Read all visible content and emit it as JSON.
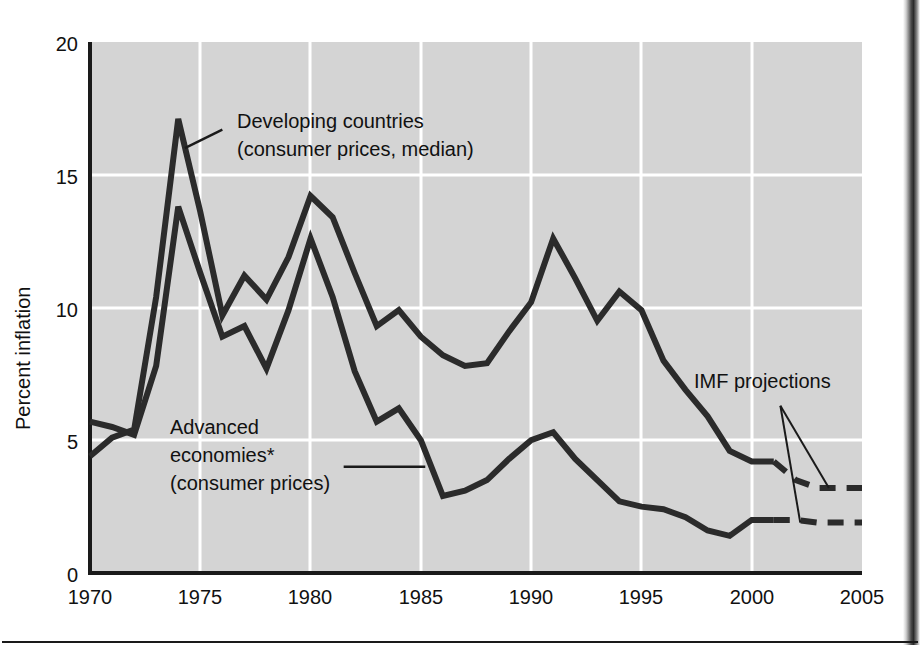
{
  "chart_data": {
    "type": "line",
    "title": "",
    "xlabel": "",
    "ylabel": "Percent inflation",
    "xlim": [
      1970,
      2005
    ],
    "ylim": [
      0,
      20
    ],
    "xticks": [
      "1970",
      "1975",
      "1980",
      "1985",
      "1990",
      "1995",
      "2000",
      "2005"
    ],
    "yticks": [
      "0",
      "5",
      "10",
      "15",
      "20"
    ],
    "grid": true,
    "legend_position": "inline-annotations",
    "plot_bg_color": "#d4d4d4",
    "gridline_color": "#ffffff",
    "line_color": "#2b2b2b",
    "x": [
      1970,
      1971,
      1972,
      1973,
      1974,
      1975,
      1976,
      1977,
      1978,
      1979,
      1980,
      1981,
      1982,
      1983,
      1984,
      1985,
      1986,
      1987,
      1988,
      1989,
      1990,
      1991,
      1992,
      1993,
      1994,
      1995,
      1996,
      1997,
      1998,
      1999,
      2000,
      2001,
      2002,
      2003,
      2004,
      2005
    ],
    "series": [
      {
        "name": "Developing countries (consumer prices, median)",
        "solid_through": 2001,
        "dashed_from": 2001,
        "values": [
          4.4,
          5.1,
          5.4,
          10.4,
          17.1,
          13.6,
          9.7,
          11.2,
          10.3,
          11.9,
          14.2,
          13.4,
          11.3,
          9.3,
          9.9,
          8.9,
          8.2,
          7.8,
          7.9,
          9.1,
          10.2,
          12.6,
          11.1,
          9.5,
          10.6,
          9.9,
          8.0,
          6.9,
          5.9,
          4.6,
          4.2,
          4.2,
          3.5,
          3.2,
          3.2,
          3.2
        ]
      },
      {
        "name": "Advanced economies* (consumer prices)",
        "solid_through": 2001,
        "dashed_from": 2001,
        "values": [
          5.7,
          5.5,
          5.2,
          7.8,
          13.8,
          11.3,
          8.9,
          9.3,
          7.7,
          9.9,
          12.6,
          10.4,
          7.6,
          5.7,
          6.2,
          5.0,
          2.9,
          3.1,
          3.5,
          4.3,
          5.0,
          5.3,
          4.3,
          3.5,
          2.7,
          2.5,
          2.4,
          2.1,
          1.6,
          1.4,
          2.0,
          2.0,
          2.0,
          1.9,
          1.9,
          1.9
        ]
      }
    ],
    "annotations": [
      {
        "id": "developing-annotation",
        "line1": "Developing countries",
        "line2": "(consumer prices, median)",
        "leader_from_x": 1976.0,
        "leader_from_y": 16.7,
        "leader_to_x": 1974.3,
        "leader_to_y": 16.0
      },
      {
        "id": "advanced-annotation",
        "line1": "Advanced",
        "line2": "economies*",
        "line3": "(consumer prices)",
        "leader_from_x": 1981.5,
        "leader_from_y": 4.0,
        "leader_to_x": 1985.2,
        "leader_to_y": 4.0
      },
      {
        "id": "imf-projections-annotation",
        "line1": "IMF projections",
        "leader_from_x": 2001.3,
        "leader_from_y": 6.3,
        "leader_to_a_x": 2003.5,
        "leader_to_a_y": 3.2,
        "leader_to_b_x": 2002.2,
        "leader_to_b_y": 1.9
      }
    ]
  },
  "axis": {
    "y_title": "Percent inflation",
    "y_tick_0": "0",
    "y_tick_5": "5",
    "y_tick_10": "10",
    "y_tick_15": "15",
    "y_tick_20": "20",
    "x_tick_1970": "1970",
    "x_tick_1975": "1975",
    "x_tick_1980": "1980",
    "x_tick_1985": "1985",
    "x_tick_1990": "1990",
    "x_tick_1995": "1995",
    "x_tick_2000": "2000",
    "x_tick_2005": "2005"
  },
  "labels": {
    "developing_line1": "Developing countries",
    "developing_line2": "(consumer prices, median)",
    "advanced_line1": "Advanced",
    "advanced_line2": "economies*",
    "advanced_line3": "(consumer prices)",
    "imf_projections": "IMF projections"
  }
}
